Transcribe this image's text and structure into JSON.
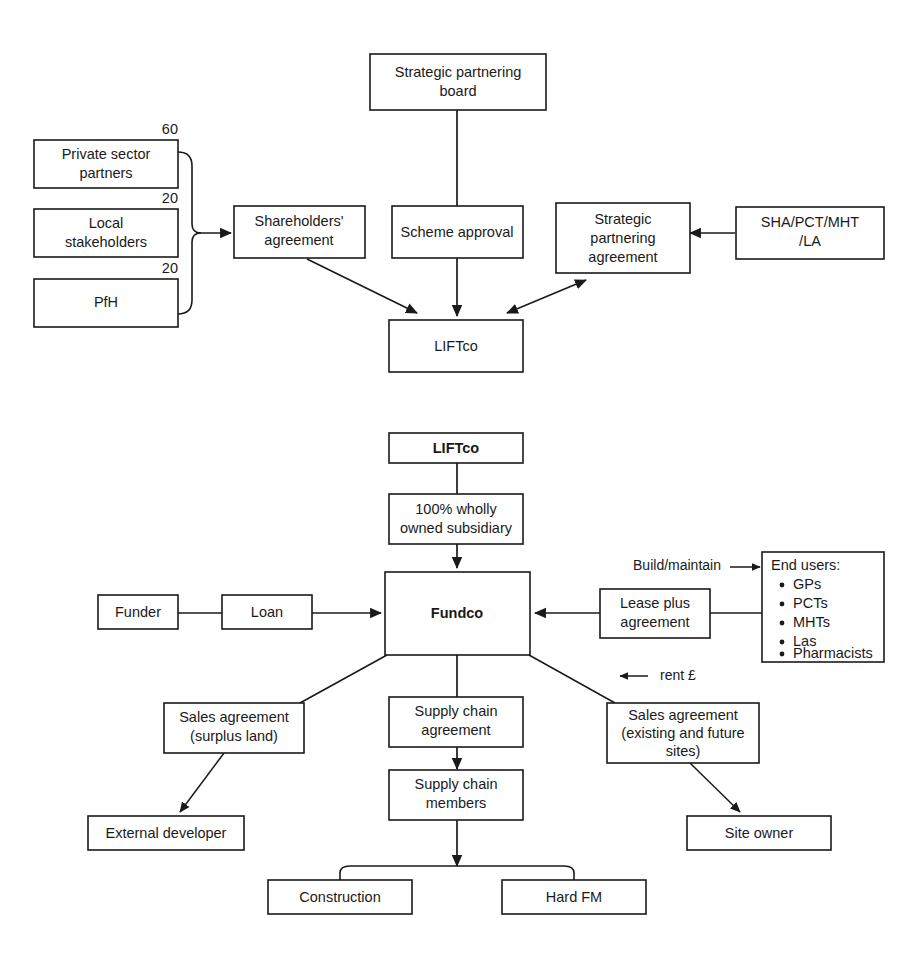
{
  "figure": {
    "background_color": "#ffffff",
    "line_color": "#1a1a1a",
    "type": "flow-diagram"
  },
  "top_diagram": {
    "name": "LIFT governance structure",
    "nodes": {
      "strategic_partnering_board": "Strategic partnering\nboard",
      "strategic_partnering_board_l1": "Strategic partnering",
      "strategic_partnering_board_l2": "board",
      "private_sector_partners_l1": "Private sector",
      "private_sector_partners_l2": "partners",
      "local_stakeholders_l1": "Local",
      "local_stakeholders_l2": "stakeholders",
      "pfh": "PfH",
      "shareholders_agreement_l1": "Shareholders'",
      "shareholders_agreement_l2": "agreement",
      "scheme_approval": "Scheme approval",
      "strategic_partnering_agreement_l1": "Strategic",
      "strategic_partnering_agreement_l2": "partnering",
      "strategic_partnering_agreement_l3": "agreement",
      "sha_pct_mht_la_l1": "SHA/PCT/MHT",
      "sha_pct_mht_la_l2": "/LA",
      "liftco": "LIFTco"
    },
    "shareholdings": {
      "private_sector_partners": "60",
      "local_stakeholders": "20",
      "pfh": "20"
    }
  },
  "bottom_diagram": {
    "name": "Fundco contractual structure",
    "nodes": {
      "liftco": "LIFTco",
      "subsidiary_l1": "100% wholly",
      "subsidiary_l2": "owned subsidiary",
      "fundco": "Fundco",
      "funder": "Funder",
      "loan": "Loan",
      "lease_plus_agreement_l1": "Lease plus",
      "lease_plus_agreement_l2": "agreement",
      "end_users_title": "End users:",
      "sales_agreement_surplus_l1": "Sales agreement",
      "sales_agreement_surplus_l2": "(surplus land)",
      "external_developer": "External developer",
      "supply_chain_agreement_l1": "Supply chain",
      "supply_chain_agreement_l2": "agreement",
      "supply_chain_members_l1": "Supply chain",
      "supply_chain_members_l2": "members",
      "construction": "Construction",
      "hard_fm": "Hard FM",
      "sales_agreement_existing_l1": "Sales agreement",
      "sales_agreement_existing_l2": "(existing and future",
      "sales_agreement_existing_l3": "sites)",
      "site_owner": "Site owner"
    },
    "end_users": [
      "GPs",
      "PCTs",
      "MHTs",
      "Las",
      "Pharmacists"
    ],
    "edge_labels": {
      "build_maintain": "Build/maintain",
      "rent": "rent £"
    }
  }
}
